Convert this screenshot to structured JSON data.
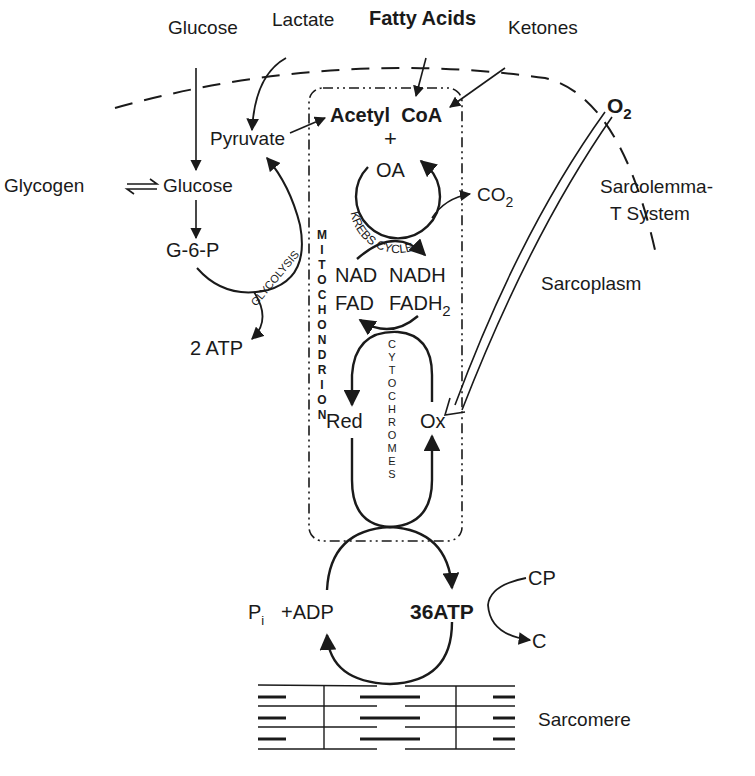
{
  "diagram": {
    "type": "metabolic-pathway",
    "colors": {
      "ink": "#1a1a1a",
      "background": "#ffffff"
    },
    "substrates": {
      "glucose_outside": "Glucose",
      "lactate": "Lactate",
      "fatty_acids": "Fatty Acids",
      "ketones": "Ketones",
      "oxygen": "O",
      "oxygen_sub": "2"
    },
    "cytoplasm": {
      "glycogen": "Glycogen",
      "glucose": "Glucose",
      "g6p": "G-6-P",
      "pyruvate": "Pyruvate",
      "glycolysis": "GLYCOLYSIS",
      "two_atp": "2 ATP"
    },
    "mitochondrion": {
      "label": "MITOCHONDRION",
      "acetyl_coa": "Acetyl  CoA",
      "plus": "+",
      "oa": "OA",
      "krebs_cycle": "KREBS CYCLE",
      "co2": "CO",
      "co2_sub": "2",
      "nad": "NAD",
      "nadh": "NADH",
      "fad": "FAD",
      "fadh2": "FADH",
      "fadh2_sub": "2",
      "cytochromes": "CYTOCHROMES",
      "red": "Red",
      "ox": "Ox"
    },
    "energy": {
      "pi": "P",
      "pi_sub": "i",
      "adp": "+ADP",
      "atp36": "36ATP",
      "cp": "CP",
      "c": "C"
    },
    "structures": {
      "sarcolemma": "Sarcolemma-",
      "t_system": "T System",
      "sarcoplasm": "Sarcoplasm",
      "sarcomere": "Sarcomere"
    }
  }
}
